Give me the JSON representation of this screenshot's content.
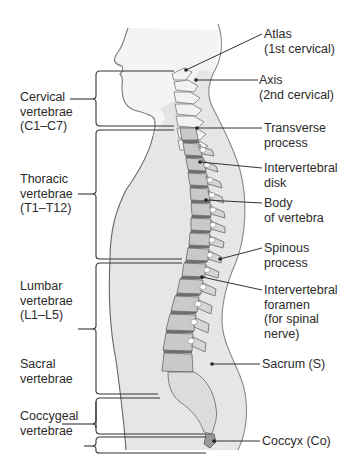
{
  "figure": {
    "colors": {
      "background": "#ffffff",
      "body_fill": "#e6e6e6",
      "body_outline": "#8a8a8a",
      "head_fill": "#f4f4f4",
      "vertebra_fill": "#c9c9c9",
      "cervical_fill": "#f2f2f2",
      "disk_fill": "#6e6e6e",
      "line": "#333333",
      "text": "#2b2b2b"
    }
  },
  "regions": [
    {
      "id": "cervical",
      "lines": [
        "Cervical",
        "vertebrae",
        "(C1–C7)"
      ]
    },
    {
      "id": "thoracic",
      "lines": [
        "Thoracic",
        "vertebrae",
        "(T1–T12)"
      ]
    },
    {
      "id": "lumbar",
      "lines": [
        "Lumbar",
        "vertebrae",
        "(L1–L5)"
      ]
    },
    {
      "id": "sacral",
      "lines": [
        "Sacral",
        "vertebrae"
      ]
    },
    {
      "id": "coccygeal",
      "lines": [
        "Coccygeal",
        "vertebrae"
      ]
    }
  ],
  "parts": [
    {
      "id": "atlas",
      "lines": [
        "Atlas",
        "(1st cervical)"
      ]
    },
    {
      "id": "axis",
      "lines": [
        "Axis",
        "(2nd cervical)"
      ]
    },
    {
      "id": "transverse-process",
      "lines": [
        "Transverse",
        "process"
      ]
    },
    {
      "id": "intervertebral-disk",
      "lines": [
        "Intervertebral",
        "disk"
      ]
    },
    {
      "id": "body-of-vertebra",
      "lines": [
        "Body",
        "of vertebra"
      ]
    },
    {
      "id": "spinous-process",
      "lines": [
        "Spinous",
        "process"
      ]
    },
    {
      "id": "intervertebral-foramen",
      "lines": [
        "Intervertebral",
        "foramen",
        "(for spinal",
        "nerve)"
      ]
    },
    {
      "id": "sacrum",
      "lines": [
        "Sacrum (S)"
      ]
    },
    {
      "id": "coccyx",
      "lines": [
        "Coccyx (Co)"
      ]
    }
  ]
}
